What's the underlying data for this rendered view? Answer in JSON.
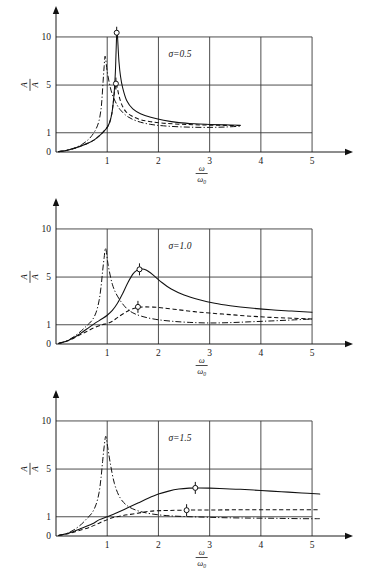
{
  "figure": {
    "title": "",
    "panel_count": 3
  },
  "chart_data": [
    {
      "type": "line",
      "title": "",
      "annotation": "σ=0.5",
      "sigma": 0.5,
      "xlabel_numerator": "ω",
      "xlabel_denominator": "ω",
      "xlabel_denominator_sub": "0",
      "ylabel_numerator": "A",
      "ylabel_denominator": "A",
      "xlim": [
        0,
        5.35
      ],
      "ylim": [
        0,
        11.6
      ],
      "xticks": [
        1,
        2,
        3,
        4,
        5
      ],
      "yticks": [
        0,
        1,
        5,
        10
      ],
      "xtick_labels": [
        "1",
        "2",
        "3",
        "4",
        "5"
      ],
      "ytick_labels": [
        "0",
        "1",
        "5",
        "10"
      ],
      "grid": true,
      "legend": "",
      "series": [
        {
          "name": "solid",
          "style": "solid",
          "x": [
            0.05,
            0.2,
            0.35,
            0.5,
            0.62,
            0.74,
            0.85,
            0.94,
            1.0,
            1.05,
            1.09,
            1.12,
            1.14,
            1.16,
            1.17,
            1.18,
            1.185,
            1.19,
            1.2,
            1.21,
            1.23,
            1.26,
            1.3,
            1.38,
            1.5,
            1.65,
            1.85,
            2.1,
            2.4,
            2.7,
            3.0,
            3.3,
            3.6
          ],
          "y": [
            0.02,
            0.08,
            0.18,
            0.32,
            0.45,
            0.62,
            0.85,
            1.15,
            1.45,
            1.9,
            2.6,
            3.6,
            4.6,
            6.4,
            8.0,
            9.6,
            10.3,
            10.5,
            10.2,
            9.2,
            7.4,
            5.9,
            4.8,
            3.7,
            3.0,
            2.6,
            2.3,
            2.05,
            1.85,
            1.75,
            1.7,
            1.66,
            1.63
          ]
        },
        {
          "name": "dashed",
          "style": "dashed",
          "x": [
            0.05,
            0.2,
            0.35,
            0.5,
            0.62,
            0.74,
            0.85,
            0.94,
            1.0,
            1.05,
            1.09,
            1.12,
            1.14,
            1.16,
            1.17,
            1.18,
            1.2,
            1.23,
            1.28,
            1.36,
            1.48,
            1.65,
            1.85,
            2.1,
            2.4,
            2.7,
            3.0,
            3.3,
            3.6
          ],
          "y": [
            0.02,
            0.08,
            0.18,
            0.32,
            0.45,
            0.62,
            0.85,
            1.15,
            1.45,
            1.9,
            2.6,
            3.6,
            4.4,
            5.0,
            5.2,
            5.1,
            4.7,
            4.1,
            3.4,
            2.8,
            2.4,
            2.1,
            1.93,
            1.8,
            1.72,
            1.67,
            1.64,
            1.62,
            1.6
          ]
        },
        {
          "name": "dash-dot",
          "style": "dashdot",
          "x": [
            0.05,
            0.2,
            0.35,
            0.5,
            0.62,
            0.7,
            0.78,
            0.84,
            0.88,
            0.9,
            0.92,
            0.94,
            0.96,
            1.0,
            1.05,
            1.1,
            1.16,
            1.25,
            1.4,
            1.6,
            1.85,
            2.1,
            2.4,
            2.7,
            3.0,
            3.3,
            3.6
          ],
          "y": [
            0.02,
            0.08,
            0.2,
            0.38,
            0.62,
            0.85,
            1.3,
            2.0,
            3.0,
            4.0,
            5.4,
            6.9,
            8.0,
            6.4,
            5.0,
            4.2,
            3.6,
            2.95,
            2.35,
            1.95,
            1.7,
            1.58,
            1.5,
            1.46,
            1.45,
            1.48,
            1.55
          ]
        }
      ],
      "markers": [
        {
          "x": 1.185,
          "y": 10.45,
          "label": ""
        },
        {
          "x": 1.17,
          "y": 5.15,
          "label": ""
        }
      ]
    },
    {
      "type": "line",
      "title": "",
      "annotation": "σ=1.0",
      "sigma": 1.0,
      "xlabel_numerator": "ω",
      "xlabel_denominator": "ω",
      "xlabel_denominator_sub": "0",
      "ylabel_numerator": "A",
      "ylabel_denominator": "A",
      "xlim": [
        0,
        5.35
      ],
      "ylim": [
        0,
        11.6
      ],
      "xticks": [
        1,
        2,
        3,
        4,
        5
      ],
      "yticks": [
        0,
        1,
        5,
        10
      ],
      "xtick_labels": [
        "1",
        "2",
        "3",
        "4",
        "5"
      ],
      "ytick_labels": [
        "0",
        "1",
        "5",
        "10"
      ],
      "grid": true,
      "legend": "",
      "series": [
        {
          "name": "solid",
          "style": "solid",
          "x": [
            0.05,
            0.25,
            0.45,
            0.6,
            0.75,
            0.9,
            1.0,
            1.1,
            1.2,
            1.3,
            1.4,
            1.5,
            1.58,
            1.65,
            1.72,
            1.8,
            1.9,
            2.05,
            2.25,
            2.5,
            2.8,
            3.1,
            3.4,
            3.8,
            4.2,
            4.6,
            5.0
          ],
          "y": [
            0.03,
            0.2,
            0.5,
            0.78,
            1.1,
            1.5,
            1.8,
            2.2,
            2.8,
            3.6,
            4.5,
            5.3,
            5.7,
            5.85,
            5.8,
            5.6,
            5.2,
            4.6,
            4.0,
            3.5,
            3.1,
            2.8,
            2.6,
            2.4,
            2.25,
            2.15,
            2.05
          ]
        },
        {
          "name": "dashed",
          "style": "dashed",
          "x": [
            0.05,
            0.25,
            0.45,
            0.6,
            0.75,
            0.9,
            1.0,
            1.1,
            1.2,
            1.32,
            1.45,
            1.55,
            1.65,
            1.75,
            1.9,
            2.1,
            2.4,
            2.7,
            3.0,
            3.4,
            3.8,
            4.2,
            4.6,
            5.0
          ],
          "y": [
            0.03,
            0.18,
            0.45,
            0.65,
            0.85,
            1.0,
            1.1,
            1.3,
            1.6,
            1.95,
            2.25,
            2.4,
            2.48,
            2.5,
            2.48,
            2.4,
            2.25,
            2.1,
            1.98,
            1.85,
            1.72,
            1.62,
            1.55,
            1.48
          ]
        },
        {
          "name": "dash-dot",
          "style": "dashdot",
          "x": [
            0.05,
            0.2,
            0.35,
            0.5,
            0.6,
            0.7,
            0.78,
            0.84,
            0.88,
            0.91,
            0.94,
            0.97,
            1.02,
            1.1,
            1.2,
            1.35,
            1.5,
            1.7,
            1.95,
            2.25,
            2.6,
            3.0,
            3.4,
            3.8,
            4.2,
            4.6,
            5.0
          ],
          "y": [
            0.03,
            0.15,
            0.38,
            0.7,
            0.95,
            1.35,
            2.0,
            3.0,
            4.2,
            5.6,
            7.0,
            8.0,
            6.2,
            4.4,
            3.4,
            2.5,
            2.0,
            1.68,
            1.45,
            1.3,
            1.2,
            1.15,
            1.18,
            1.25,
            1.32,
            1.4,
            1.48
          ]
        }
      ],
      "markers": [
        {
          "x": 1.63,
          "y": 5.8,
          "label": ""
        },
        {
          "x": 1.6,
          "y": 2.5,
          "label": ""
        }
      ]
    },
    {
      "type": "line",
      "title": "",
      "annotation": "σ=1.5",
      "sigma": 1.5,
      "xlabel_numerator": "ω",
      "xlabel_denominator": "ω",
      "xlabel_denominator_sub": "0",
      "ylabel_numerator": "A",
      "ylabel_denominator": "A",
      "xlim": [
        0,
        5.35
      ],
      "ylim": [
        0,
        11.6
      ],
      "xticks": [
        1,
        2,
        3,
        4,
        5
      ],
      "yticks": [
        0,
        1,
        5,
        10
      ],
      "xtick_labels": [
        "1",
        "2",
        "3",
        "4",
        "5"
      ],
      "ytick_labels": [
        "0",
        "1",
        "5",
        "10"
      ],
      "grid": true,
      "legend": "",
      "series": [
        {
          "name": "solid",
          "style": "solid",
          "x": [
            0.05,
            0.25,
            0.5,
            0.7,
            0.85,
            1.0,
            1.2,
            1.4,
            1.6,
            1.8,
            2.0,
            2.2,
            2.4,
            2.6,
            2.8,
            3.0,
            3.3,
            3.6,
            4.0,
            4.4,
            4.8,
            5.15
          ],
          "y": [
            0.03,
            0.15,
            0.4,
            0.62,
            0.85,
            1.0,
            1.35,
            1.75,
            2.15,
            2.55,
            2.9,
            3.15,
            3.32,
            3.4,
            3.42,
            3.4,
            3.35,
            3.3,
            3.2,
            3.1,
            3.0,
            2.9
          ]
        },
        {
          "name": "dashed",
          "style": "dashed",
          "x": [
            0.05,
            0.25,
            0.5,
            0.7,
            0.85,
            1.0,
            1.15,
            1.3,
            1.45,
            1.6,
            1.7,
            1.8,
            1.95,
            2.2,
            2.6,
            3.0,
            3.5,
            4.0,
            4.5,
            5.15
          ],
          "y": [
            0.03,
            0.13,
            0.32,
            0.5,
            0.68,
            0.85,
            0.98,
            1.1,
            1.2,
            1.3,
            1.38,
            1.45,
            1.5,
            1.53,
            1.56,
            1.57,
            1.58,
            1.58,
            1.58,
            1.58
          ]
        },
        {
          "name": "dash-dot",
          "style": "dashdot",
          "x": [
            0.05,
            0.2,
            0.35,
            0.5,
            0.6,
            0.7,
            0.78,
            0.84,
            0.88,
            0.91,
            0.94,
            0.97,
            1.0,
            1.06,
            1.14,
            1.25,
            1.4,
            1.6,
            1.85,
            2.15,
            2.5,
            2.9,
            3.3,
            3.8,
            4.3,
            4.8,
            5.15
          ],
          "y": [
            0.03,
            0.12,
            0.32,
            0.62,
            0.9,
            1.3,
            2.0,
            3.0,
            4.3,
            5.8,
            7.3,
            8.4,
            7.6,
            5.6,
            3.8,
            2.6,
            1.9,
            1.5,
            1.25,
            1.1,
            1.02,
            0.98,
            0.95,
            0.93,
            0.92,
            0.9,
            0.9
          ]
        }
      ],
      "markers": [
        {
          "x": 2.72,
          "y": 3.42,
          "label": ""
        },
        {
          "x": 2.55,
          "y": 1.55,
          "label": ""
        }
      ]
    }
  ],
  "colors": {
    "stroke": "#111111",
    "grid": "#3a3a3a",
    "background": "#ffffff"
  }
}
